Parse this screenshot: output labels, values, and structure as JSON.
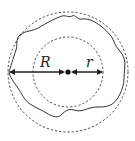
{
  "diagram": {
    "labels": {
      "outer_radius": "R",
      "inner_radius": "r"
    },
    "colors": {
      "stroke": "#222222",
      "background": "#ffffff"
    },
    "elements": [
      "outer-dashed-circle",
      "inner-dashed-circle",
      "irregular-boundary",
      "center-point",
      "R-arrow",
      "r-arrow"
    ]
  }
}
